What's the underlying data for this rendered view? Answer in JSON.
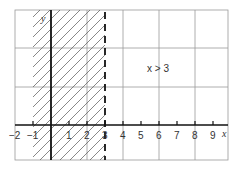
{
  "diagram": {
    "type": "inequality-graph",
    "inequality_label": "x > 3",
    "boundary": {
      "x": 3,
      "style": "dashed"
    },
    "shaded_region": "x < 3 (hatched, excluded)",
    "axes": {
      "x_label": "x",
      "y_label": "y",
      "x_ticks": [
        "−2",
        "−1",
        "1",
        "2",
        "3",
        "4",
        "5",
        "6",
        "7",
        "8",
        "9"
      ]
    },
    "colors": {
      "grid": "#9a9a9a",
      "axis": "#111111",
      "hatch": "#555555",
      "background": "#ffffff"
    }
  }
}
